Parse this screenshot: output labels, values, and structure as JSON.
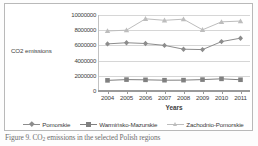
{
  "caption": {
    "prefix": "Figure 9. CO",
    "subscript": "2",
    "suffix": " emissions in the selected Polish regions"
  },
  "chart_data": {
    "type": "line",
    "title": "",
    "xlabel": "Years",
    "ylabel": "CO2 emissions",
    "categories": [
      "2004",
      "2005",
      "2006",
      "2007",
      "2008",
      "2009",
      "2010",
      "2011"
    ],
    "ylim": [
      0,
      10000000
    ],
    "ytick_labels": [
      "10000000",
      "8000000",
      "6000000",
      "4000000",
      "2000000",
      "0"
    ],
    "ytick_values": [
      10000000,
      8000000,
      6000000,
      4000000,
      2000000,
      0
    ],
    "grid": true,
    "legend_position": "bottom",
    "series": [
      {
        "name": "Pomorskie",
        "color": "#8c8c8c",
        "marker": "diamond",
        "values": [
          6200000,
          6350000,
          6250000,
          6000000,
          5500000,
          5450000,
          6500000,
          6950000
        ]
      },
      {
        "name": "Warmińsko-Mazurskie",
        "color": "#808080",
        "marker": "square",
        "values": [
          1400000,
          1500000,
          1470000,
          1420000,
          1430000,
          1500000,
          1600000,
          1480000
        ]
      },
      {
        "name": "Zachodnio-Pomorskie",
        "color": "#bdbdbd",
        "marker": "triangle",
        "values": [
          7900000,
          8000000,
          9500000,
          9300000,
          9450000,
          8050000,
          9100000,
          9200000
        ]
      }
    ]
  }
}
